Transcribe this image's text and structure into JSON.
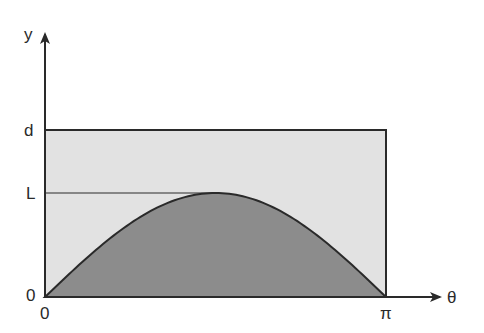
{
  "diagram": {
    "type": "buffon-needle-region",
    "y_axis_label": "y",
    "x_axis_label": "θ",
    "y_ticks": [
      {
        "label": "d",
        "meaning": "rectangle top"
      },
      {
        "label": "L",
        "meaning": "curve peak / needle length"
      },
      {
        "label": "0",
        "meaning": "origin y"
      }
    ],
    "x_ticks": [
      {
        "label": "0"
      },
      {
        "label": "π"
      }
    ],
    "regions": [
      {
        "name": "rectangle",
        "bounds": "0 ≤ θ ≤ π, 0 ≤ y ≤ d",
        "fill": "#e2e2e2"
      },
      {
        "name": "under-curve",
        "curve": "y = L·sin θ",
        "fill": "#8c8c8c"
      }
    ],
    "colors": {
      "line": "#2a2a2a",
      "rect_fill": "#e2e2e2",
      "curve_fill": "#8c8c8c"
    }
  }
}
